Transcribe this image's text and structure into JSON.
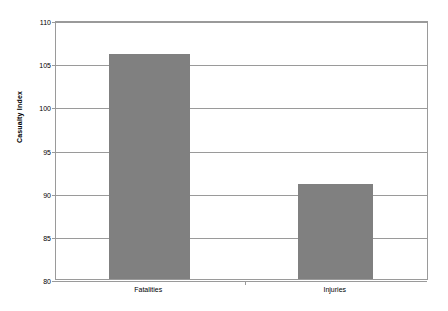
{
  "chart_data": {
    "type": "bar",
    "title": "",
    "xlabel": "",
    "ylabel": "Casualty Index",
    "categories": [
      "Fatalities",
      "Injuries"
    ],
    "values": [
      106.1,
      91.0
    ],
    "ylim": [
      80,
      110
    ],
    "ytick_step": 5,
    "yticks": [
      110,
      105,
      100,
      95,
      90,
      85,
      80
    ],
    "ytick_labels": [
      "110",
      "105",
      "100",
      "95",
      "90",
      "85",
      "80"
    ],
    "grid": true,
    "legend": false,
    "legend_position": "none",
    "series": [
      {
        "name": "Casualty Index",
        "values": [
          106.1,
          91.0
        ]
      }
    ],
    "colors": {
      "bar_fill": "#808080",
      "gridline": "#9a9a9a",
      "axis": "#9a9a9a",
      "text": "#000000",
      "background": "#ffffff"
    }
  }
}
